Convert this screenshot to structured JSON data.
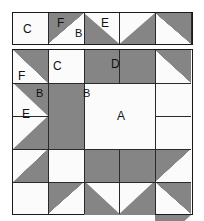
{
  "figure": {
    "type": "quilt-block-piecing-diagram",
    "colors": {
      "dark_fabric": "#858585",
      "light_fabric": "#fbfbfb",
      "outline": "#2a2a2a",
      "background": "#ffffff",
      "label_text": "#111111"
    },
    "grid": {
      "columns": 5,
      "rows": 5
    }
  },
  "top_strip": {
    "name": "border-strip",
    "cells": [
      {
        "id": "ts1",
        "patch": "square",
        "shading": "light",
        "label": "C"
      },
      {
        "id": "ts2",
        "patch": "half-square",
        "shading": "dark-upper-left",
        "label": "F"
      },
      {
        "id": "ts3",
        "patch": "flying-geese",
        "shading": "light-triangle-down",
        "label": "E",
        "corner_label": "B"
      },
      {
        "id": "ts4",
        "patch": "half-square",
        "shading": "dark-upper-right",
        "label": ""
      },
      {
        "id": "ts5",
        "patch": "square",
        "shading": "light",
        "label": ""
      }
    ]
  },
  "main_block": {
    "name": "five-patch-block",
    "rows": [
      {
        "row": 1,
        "cells": [
          {
            "id": "r1c1",
            "patch": "half-square",
            "shading": "dark-upper-right",
            "label": "F"
          },
          {
            "id": "r1c2",
            "patch": "square",
            "shading": "light",
            "label": "C"
          },
          {
            "id": "r1c3",
            "patch": "rectangle",
            "shading": "dark",
            "label": "D"
          },
          {
            "id": "r1c4",
            "patch": "square",
            "shading": "light",
            "label": ""
          },
          {
            "id": "r1c5",
            "patch": "half-square",
            "shading": "dark-upper-right",
            "label": ""
          }
        ]
      },
      {
        "row": 2,
        "cells": [
          {
            "id": "r2c1",
            "patch": "flying-geese",
            "shading": "light-triangle-right",
            "label": "E",
            "corner_label": "B"
          },
          {
            "id": "r2c2",
            "patch": "rectangle",
            "shading": "dark",
            "label": ""
          },
          {
            "id": "r2c3",
            "patch": "square-in-square",
            "shading": "light-diamond-on-dark",
            "label": "A",
            "corner_label": "B"
          },
          {
            "id": "r2c4",
            "patch": "rectangle",
            "shading": "light",
            "label": ""
          },
          {
            "id": "r2c5",
            "patch": "flying-geese",
            "shading": "light-triangle-left",
            "label": ""
          }
        ]
      },
      {
        "row": 3,
        "cells": [
          {
            "id": "r3c1",
            "patch": "half-square",
            "shading": "dark-lower-right",
            "label": ""
          },
          {
            "id": "r3c2",
            "patch": "square",
            "shading": "light",
            "label": ""
          },
          {
            "id": "r3c3",
            "patch": "rectangle",
            "shading": "dark",
            "label": ""
          },
          {
            "id": "r3c4",
            "patch": "square",
            "shading": "light",
            "label": ""
          },
          {
            "id": "r3c5",
            "patch": "half-square",
            "shading": "dark-upper-left",
            "label": ""
          }
        ]
      },
      {
        "row": 4,
        "cells": [
          {
            "id": "r4c1",
            "patch": "square",
            "shading": "light",
            "label": ""
          },
          {
            "id": "r4c2",
            "patch": "half-square",
            "shading": "dark-upper-left",
            "label": ""
          },
          {
            "id": "r4c3",
            "patch": "flying-geese",
            "shading": "light-triangle-up",
            "label": ""
          },
          {
            "id": "r4c4",
            "patch": "half-square",
            "shading": "dark-upper-right",
            "label": ""
          },
          {
            "id": "r4c5",
            "patch": "square",
            "shading": "light",
            "label": ""
          }
        ]
      }
    ]
  },
  "piece_labels": {
    "A": "A",
    "B": "B",
    "C": "C",
    "D": "D",
    "E": "E",
    "F": "F"
  }
}
